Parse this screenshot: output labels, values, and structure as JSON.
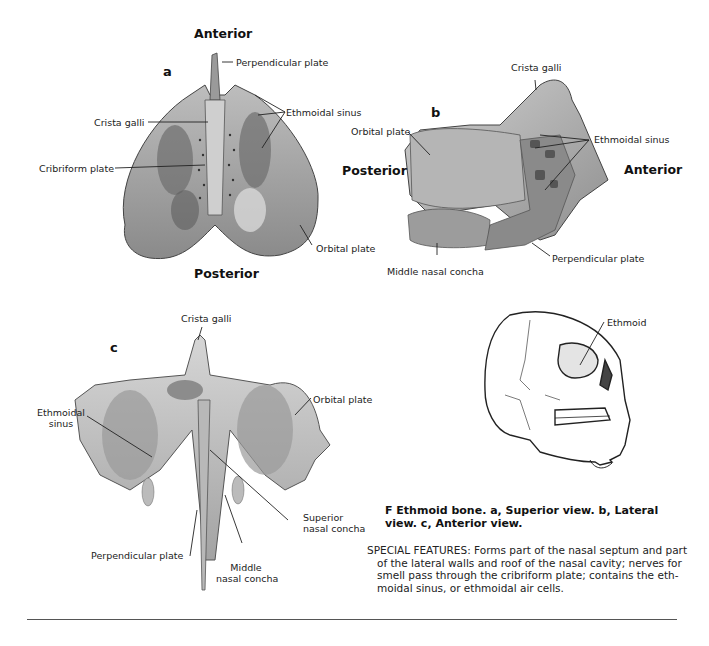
{
  "figure": {
    "caption_title": "F Ethmoid bone. a, Superior view. b, Lateral view. c, Anterior view.",
    "special_features": "SPECIAL FEATURES: Forms part of the nasal septum and part of the lateral walls and roof of the nasal cavity; nerves for smell pass through the cribriform plate; contains the eth-moidal sinus, or ethmoidal air cells."
  },
  "panel_a": {
    "letter": "a",
    "view": "Superior view",
    "orientation_top": "Anterior",
    "orientation_bottom": "Posterior",
    "labels": {
      "perpendicular_plate": "Perpendicular plate",
      "crista_galli": "Crista galli",
      "ethmoidal_sinus": "Ethmoidal sinus",
      "cribriform_plate": "Cribriform plate",
      "orbital_plate": "Orbital plate"
    }
  },
  "panel_b": {
    "letter": "b",
    "view": "Lateral view",
    "orientation_left": "Posterior",
    "orientation_right": "Anterior",
    "labels": {
      "crista_galli": "Crista galli",
      "orbital_plate": "Orbital plate",
      "ethmoidal_sinus": "Ethmoidal sinus",
      "middle_nasal_concha": "Middle nasal concha",
      "perpendicular_plate": "Perpendicular plate"
    }
  },
  "panel_c": {
    "letter": "c",
    "view": "Anterior view",
    "labels": {
      "crista_galli": "Crista galli",
      "ethmoidal_sinus_line1": "Ethmoidal",
      "ethmoidal_sinus_line2": "sinus",
      "orbital_plate": "Orbital plate",
      "superior_nasal_concha_line1": "Superior",
      "superior_nasal_concha_line2": "nasal concha",
      "perpendicular_plate": "Perpendicular plate",
      "middle_nasal_concha_line1": "Middle",
      "middle_nasal_concha_line2": "nasal concha"
    }
  },
  "skull_inset": {
    "label": "Ethmoid"
  }
}
